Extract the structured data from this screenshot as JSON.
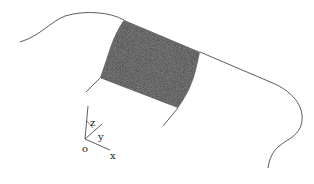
{
  "diagram": {
    "type": "surface-patch-with-coordinate-axes",
    "colors": {
      "line": "#333333",
      "patch_fill": "#4a4a4a",
      "background": "#ffffff"
    },
    "axes": {
      "origin_label": "o",
      "x_label": "x",
      "y_label": "y",
      "z_label": "z"
    }
  }
}
